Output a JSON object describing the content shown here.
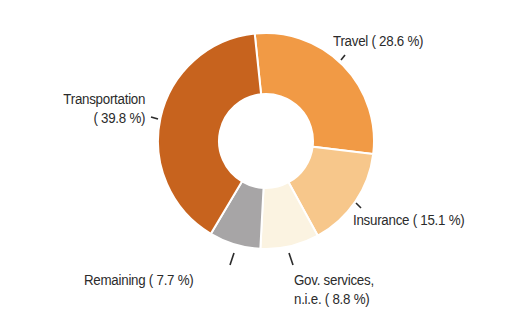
{
  "chart_data": {
    "type": "pie",
    "variant": "donut",
    "title": "",
    "start_angle_deg": -6,
    "direction": "clockwise",
    "center": [
      266,
      141
    ],
    "outer_radius": 108,
    "inner_radius": 47,
    "slice_separator_color": "#ffffff",
    "slices": [
      {
        "name": "Travel",
        "value": 28.6,
        "color": "#F19A45",
        "label": "Travel ( 28.6 %)"
      },
      {
        "name": "Insurance",
        "value": 15.1,
        "color": "#F7C78B",
        "label": "Insurance ( 15.1 %)"
      },
      {
        "name": "Gov. services, n.i.e.",
        "value": 8.8,
        "color": "#FBF3E1",
        "label_line1": "Gov. services,",
        "label_line2": "n.i.e. ( 8.8 %)"
      },
      {
        "name": "Remaining",
        "value": 7.7,
        "color": "#A7A5A6",
        "label": "Remaining ( 7.7 %)"
      },
      {
        "name": "Transportation",
        "value": 39.8,
        "color": "#C7631E",
        "label_line1": "Transportation",
        "label_line2": "( 39.8 %)"
      }
    ],
    "legend": "none (direct labels with leader ticks)",
    "unit": "%"
  },
  "labels": {
    "travel": "Travel ( 28.6 %)",
    "insurance": "Insurance ( 15.1 %)",
    "gov_line1": "Gov. services,",
    "gov_line2": "n.i.e. (  8.8 %)",
    "remaining": "Remaining (  7.7 %)",
    "transport_line1": "Transportation",
    "transport_line2": "( 39.8 %)"
  }
}
